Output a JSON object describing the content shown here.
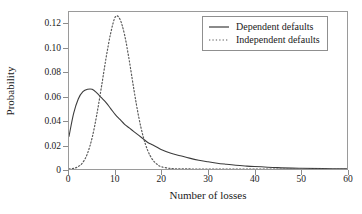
{
  "chart_data": {
    "type": "line",
    "title": "",
    "subtitle": "",
    "xlabel": "Number of losses",
    "ylabel": "Probability",
    "xlim": [
      0,
      60
    ],
    "ylim": [
      0,
      0.13
    ],
    "grid": false,
    "legend_position": "top-right",
    "xticks": [
      {
        "value": 0,
        "label": "0"
      },
      {
        "value": 10,
        "label": "10"
      },
      {
        "value": 20,
        "label": "20"
      },
      {
        "value": 30,
        "label": "30"
      },
      {
        "value": 40,
        "label": "40"
      },
      {
        "value": 50,
        "label": "50"
      },
      {
        "value": 60,
        "label": "60"
      }
    ],
    "yticks": [
      {
        "value": 0,
        "label": "0"
      },
      {
        "value": 0.02,
        "label": "0.02"
      },
      {
        "value": 0.04,
        "label": "0.04"
      },
      {
        "value": 0.06,
        "label": "0.06"
      },
      {
        "value": 0.08,
        "label": "0.08"
      },
      {
        "value": 0.1,
        "label": "0.10"
      },
      {
        "value": 0.12,
        "label": "0.12"
      }
    ],
    "x": [
      0,
      1,
      2,
      3,
      4,
      5,
      6,
      7,
      8,
      9,
      10,
      11,
      12,
      13,
      14,
      15,
      16,
      17,
      18,
      19,
      20,
      22,
      24,
      26,
      28,
      30,
      32,
      34,
      36,
      38,
      40,
      45,
      50,
      55,
      60
    ],
    "series": [
      {
        "name": "Dependent defaults",
        "style": "solid",
        "color": "#3c3c3c",
        "values": [
          0.027,
          0.046,
          0.058,
          0.064,
          0.066,
          0.066,
          0.063,
          0.059,
          0.055,
          0.05,
          0.045,
          0.041,
          0.037,
          0.034,
          0.031,
          0.028,
          0.025,
          0.022,
          0.02,
          0.018,
          0.016,
          0.013,
          0.011,
          0.009,
          0.0073,
          0.006,
          0.0048,
          0.0039,
          0.0031,
          0.0025,
          0.002,
          0.0011,
          0.0006,
          0.0003,
          0.0002
        ]
      },
      {
        "name": "Independent defaults",
        "style": "dotted",
        "color": "#5a5a5a",
        "values": [
          0.0001,
          0.0005,
          0.002,
          0.0055,
          0.013,
          0.026,
          0.045,
          0.068,
          0.092,
          0.1125,
          0.126,
          0.124,
          0.111,
          0.09,
          0.066,
          0.044,
          0.027,
          0.0152,
          0.008,
          0.0039,
          0.0018,
          0.0004,
          0.0001,
          3e-05,
          1e-05,
          5e-06,
          2e-06,
          1e-06,
          5e-07,
          2e-07,
          1e-07,
          0,
          0,
          0,
          0
        ]
      }
    ],
    "annotations": []
  },
  "legend": {
    "entries": [
      {
        "label": "Dependent defaults",
        "style": "solid"
      },
      {
        "label": "Independent defaults",
        "style": "dotted"
      }
    ]
  },
  "colors": {
    "background": "#ffffff",
    "frame": "#9a9a9a",
    "text": "#1a1a1a",
    "solid_series": "#3c3c3c",
    "dotted_series": "#5a5a5a"
  }
}
